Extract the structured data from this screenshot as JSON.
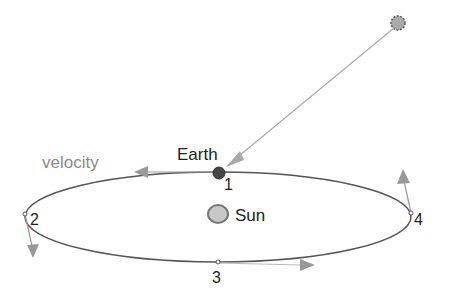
{
  "diagram": {
    "labels": {
      "earth": "Earth",
      "sun": "Sun",
      "velocity": "velocity",
      "p1": "1",
      "p2": "2",
      "p3": "3",
      "p4": "4"
    },
    "colors": {
      "orbit": "#555555",
      "arrow": "#999999",
      "earth": "#444444",
      "sun_fill": "#c8c8c8",
      "sun_stroke": "#777777",
      "star": "#aaaaaa",
      "text": "#222222",
      "velocity_text": "#8a8a8a"
    }
  }
}
